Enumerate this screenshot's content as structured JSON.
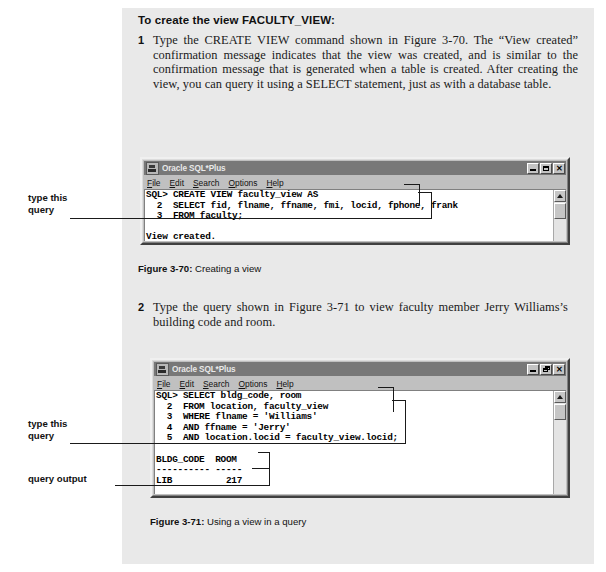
{
  "doc": {
    "heading": "To create the view FACULTY_VIEW:",
    "steps": [
      {
        "num": "1",
        "text": "Type the CREATE VIEW command shown in Figure 3-70. The “View created” confirmation message indicates that the view was created, and is similar to the confirmation message that is generated when a table is created. After creating the view, you can query it using a SELECT statement, just as with a database table."
      },
      {
        "num": "2",
        "text": "Type the query shown in Figure 3-71 to view faculty member Jerry Williams’s building code and room."
      }
    ]
  },
  "figures": [
    {
      "label": "Figure 3-70:",
      "caption": "Creating a view"
    },
    {
      "label": "Figure 3-71:",
      "caption": "Using a view in a query"
    }
  ],
  "annotations": {
    "type_this_query_1": "type this\nquery",
    "type_this_query_2": "type this\nquery",
    "query_output": "query output"
  },
  "window1": {
    "title": "Oracle SQL*Plus",
    "icon": "oracle-sqlplus-icon",
    "menus": [
      {
        "mnemonic": "F",
        "rest": "ile"
      },
      {
        "mnemonic": "E",
        "rest": "dit"
      },
      {
        "mnemonic": "S",
        "rest": "earch"
      },
      {
        "mnemonic": "O",
        "rest": "ptions"
      },
      {
        "mnemonic": "H",
        "rest": "elp"
      }
    ],
    "buttons": [
      {
        "name": "minimize-button",
        "glyph": "minimize"
      },
      {
        "name": "maximize-button",
        "glyph": "maximize"
      },
      {
        "name": "close-button",
        "glyph": "close",
        "label": "✕"
      }
    ],
    "console": "SQL> CREATE VIEW faculty_view AS\n  2  SELECT fid, flname, ffname, fmi, locid, fphone, frank\n  3  FROM faculty;\n\nView created."
  },
  "window2": {
    "title": "Oracle SQL*Plus",
    "icon": "oracle-sqlplus-icon",
    "menus": [
      {
        "mnemonic": "F",
        "rest": "ile"
      },
      {
        "mnemonic": "E",
        "rest": "dit"
      },
      {
        "mnemonic": "S",
        "rest": "earch"
      },
      {
        "mnemonic": "O",
        "rest": "ptions"
      },
      {
        "mnemonic": "H",
        "rest": "elp"
      }
    ],
    "buttons": [
      {
        "name": "minimize-button",
        "glyph": "minimize"
      },
      {
        "name": "restore-button",
        "glyph": "restore"
      },
      {
        "name": "close-button",
        "glyph": "close",
        "label": "✕"
      }
    ],
    "console": "SQL> SELECT bldg_code, room\n  2  FROM location, faculty_view\n  3  WHERE flname = 'Williams'\n  4  AND ffname = 'Jerry'\n  5  AND location.locid = faculty_view.locid;\n\nBLDG_CODE  ROOM\n---------- -----\nLIB          217"
  }
}
